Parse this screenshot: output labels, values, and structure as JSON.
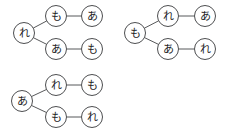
{
  "canvas": {
    "width": 235,
    "height": 133,
    "background": "#ffffff",
    "edge_color": "#57585a",
    "node_stroke_color": "#4d4e50",
    "node_fill_color": "#ffffff",
    "label_color": "#1b1b1c",
    "node_radius": 10.5
  },
  "graphs": [
    {
      "id": "graph-top-left",
      "nodes": [
        {
          "id": "g1-root",
          "label": "れ",
          "x": 24,
          "y": 33
        },
        {
          "id": "g1-branch-top",
          "label": "も",
          "x": 56,
          "y": 16
        },
        {
          "id": "g1-leaf-top",
          "label": "あ",
          "x": 92,
          "y": 16
        },
        {
          "id": "g1-branch-bot",
          "label": "あ",
          "x": 56,
          "y": 49
        },
        {
          "id": "g1-leaf-bot",
          "label": "も",
          "x": 92,
          "y": 49
        }
      ],
      "edges": [
        {
          "id": "g1-edge-1",
          "from": "g1-root",
          "to": "g1-branch-top"
        },
        {
          "id": "g1-edge-2",
          "from": "g1-branch-top",
          "to": "g1-leaf-top"
        },
        {
          "id": "g1-edge-3",
          "from": "g1-root",
          "to": "g1-branch-bot"
        },
        {
          "id": "g1-edge-4",
          "from": "g1-branch-bot",
          "to": "g1-leaf-bot"
        }
      ]
    },
    {
      "id": "graph-top-right",
      "nodes": [
        {
          "id": "g2-root",
          "label": "も",
          "x": 135,
          "y": 33
        },
        {
          "id": "g2-branch-top",
          "label": "れ",
          "x": 168,
          "y": 16
        },
        {
          "id": "g2-leaf-top",
          "label": "あ",
          "x": 205,
          "y": 16
        },
        {
          "id": "g2-branch-bot",
          "label": "あ",
          "x": 168,
          "y": 49
        },
        {
          "id": "g2-leaf-bot",
          "label": "れ",
          "x": 205,
          "y": 49
        }
      ],
      "edges": [
        {
          "id": "g2-edge-1",
          "from": "g2-root",
          "to": "g2-branch-top"
        },
        {
          "id": "g2-edge-2",
          "from": "g2-branch-top",
          "to": "g2-leaf-top"
        },
        {
          "id": "g2-edge-3",
          "from": "g2-root",
          "to": "g2-branch-bot"
        },
        {
          "id": "g2-edge-4",
          "from": "g2-branch-bot",
          "to": "g2-leaf-bot"
        }
      ]
    },
    {
      "id": "graph-bottom-left",
      "nodes": [
        {
          "id": "g3-root",
          "label": "あ",
          "x": 22,
          "y": 101
        },
        {
          "id": "g3-branch-top",
          "label": "れ",
          "x": 56,
          "y": 85
        },
        {
          "id": "g3-leaf-top",
          "label": "も",
          "x": 92,
          "y": 85
        },
        {
          "id": "g3-branch-bot",
          "label": "も",
          "x": 56,
          "y": 117
        },
        {
          "id": "g3-leaf-bot",
          "label": "れ",
          "x": 92,
          "y": 117
        }
      ],
      "edges": [
        {
          "id": "g3-edge-1",
          "from": "g3-root",
          "to": "g3-branch-top"
        },
        {
          "id": "g3-edge-2",
          "from": "g3-branch-top",
          "to": "g3-leaf-top"
        },
        {
          "id": "g3-edge-3",
          "from": "g3-root",
          "to": "g3-branch-bot"
        },
        {
          "id": "g3-edge-4",
          "from": "g3-branch-bot",
          "to": "g3-leaf-bot"
        }
      ]
    }
  ]
}
